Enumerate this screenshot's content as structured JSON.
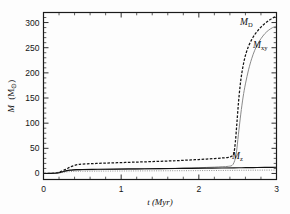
{
  "figure": {
    "title": "",
    "background_color": "#fdfdfd"
  },
  "axes": {
    "x_label": "t (Myr)",
    "y_label_main": "M",
    "y_label_unit": "(M",
    "y_label_unit_close": ")",
    "y_label_sun": "⊙",
    "x_ticklabels": [
      "0",
      "1",
      "2",
      "3"
    ],
    "y_ticklabels": [
      "0",
      "50",
      "100",
      "150",
      "200",
      "250",
      "300"
    ]
  },
  "series_labels": {
    "md": "M",
    "md_sub": "D",
    "mxy": "M",
    "mxy_sub": "xy",
    "mz": "M",
    "mz_sub": "z"
  },
  "colors": {
    "md": "#151515",
    "mxy": "#8a8a8a",
    "mz": "#121212",
    "axis": "#1a1a1a"
  },
  "chart_data": {
    "type": "line",
    "title": "",
    "xlabel": "t (Myr)",
    "ylabel": "M (M_sun)",
    "xlim": [
      0,
      3
    ],
    "ylim": [
      -12,
      320
    ],
    "xticks": [
      0,
      1,
      2,
      3
    ],
    "yticks": [
      0,
      50,
      100,
      150,
      200,
      250,
      300
    ],
    "grid": false,
    "legend": "inline-annotations",
    "series": [
      {
        "name": "M_D",
        "style": "dashed",
        "color": "#151515",
        "label_position": {
          "x": 2.72,
          "y": 300
        },
        "x": [
          0.0,
          0.1,
          0.18,
          0.22,
          0.26,
          0.3,
          0.34,
          0.38,
          0.42,
          0.46,
          0.5,
          0.6,
          0.7,
          0.8,
          0.9,
          1.0,
          1.1,
          1.2,
          1.3,
          1.4,
          1.5,
          1.6,
          1.7,
          1.8,
          1.9,
          2.0,
          2.1,
          2.2,
          2.3,
          2.38,
          2.42,
          2.45,
          2.47,
          2.49,
          2.51,
          2.53,
          2.55,
          2.58,
          2.61,
          2.64,
          2.68,
          2.72,
          2.76,
          2.8,
          2.85,
          2.9,
          2.95,
          3.0
        ],
        "y": [
          0.0,
          0.3,
          1.6,
          3.5,
          6.2,
          9.4,
          12.6,
          15.2,
          17.0,
          18.0,
          18.6,
          19.4,
          20.0,
          20.6,
          21.1,
          21.6,
          22.1,
          22.6,
          23.1,
          23.6,
          24.2,
          24.8,
          25.4,
          26.1,
          26.9,
          27.7,
          28.6,
          29.6,
          30.8,
          32.0,
          34.0,
          40.0,
          62.0,
          100.0,
          140.0,
          172.0,
          196.0,
          222.0,
          240.0,
          253.0,
          266.0,
          276.0,
          284.0,
          291.0,
          298.0,
          304.0,
          309.0,
          312.0
        ]
      },
      {
        "name": "M_xy",
        "style": "solid",
        "color": "#8a8a8a",
        "label_position": {
          "x": 2.8,
          "y": 255
        },
        "x": [
          0.0,
          0.1,
          0.18,
          0.22,
          0.26,
          0.3,
          0.34,
          0.38,
          0.42,
          0.46,
          0.5,
          0.6,
          0.7,
          0.8,
          0.9,
          1.0,
          1.1,
          1.2,
          1.3,
          1.4,
          1.5,
          1.6,
          1.7,
          1.8,
          1.9,
          2.0,
          2.1,
          2.2,
          2.3,
          2.38,
          2.44,
          2.48,
          2.51,
          2.54,
          2.57,
          2.6,
          2.64,
          2.68,
          2.72,
          2.76,
          2.8,
          2.85,
          2.9,
          2.95,
          3.0
        ],
        "y": [
          0.0,
          0.2,
          1.0,
          2.2,
          3.8,
          5.2,
          6.1,
          6.6,
          6.9,
          7.1,
          7.2,
          7.4,
          7.6,
          7.8,
          8.0,
          8.2,
          8.4,
          8.6,
          8.9,
          9.2,
          9.5,
          9.8,
          10.2,
          10.6,
          11.0,
          11.5,
          12.0,
          12.6,
          13.4,
          14.2,
          18.0,
          38.0,
          78.0,
          118.0,
          152.0,
          178.0,
          206.0,
          228.0,
          245.0,
          258.0,
          268.0,
          278.0,
          285.0,
          290.0,
          293.0
        ]
      },
      {
        "name": "M_z",
        "style": "solid",
        "color": "#121212",
        "label_position": {
          "x": 2.56,
          "y": 28
        },
        "x": [
          0.0,
          0.1,
          0.18,
          0.22,
          0.26,
          0.3,
          0.34,
          0.38,
          0.42,
          0.46,
          0.5,
          0.7,
          0.9,
          1.1,
          1.3,
          1.5,
          1.7,
          1.9,
          2.1,
          2.3,
          2.45,
          2.55,
          2.65,
          2.75,
          2.85,
          2.95,
          3.0
        ],
        "y": [
          0.0,
          0.2,
          1.0,
          2.2,
          4.0,
          5.6,
          6.6,
          7.2,
          7.5,
          7.7,
          7.9,
          8.3,
          8.7,
          9.0,
          9.3,
          9.6,
          9.9,
          10.2,
          10.5,
          10.9,
          11.2,
          11.4,
          11.6,
          11.8,
          12.0,
          12.2,
          12.3
        ]
      }
    ]
  }
}
